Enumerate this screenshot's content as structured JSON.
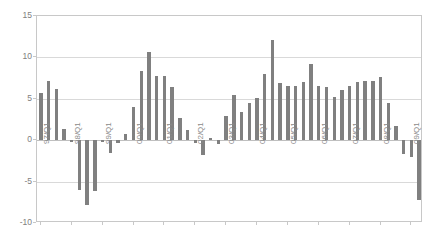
{
  "chart_data": {
    "type": "bar",
    "title": "",
    "subtitle": "",
    "xlabel": "",
    "ylabel": "",
    "ylim": [
      -10,
      15
    ],
    "yticks": [
      15,
      10,
      5,
      0,
      -5,
      -10
    ],
    "ytick_labels": [
      "15",
      "10",
      "5",
      "0",
      "-5",
      "-10"
    ],
    "grid": true,
    "legend": false,
    "legend_position": "none",
    "bar_color": "#808080",
    "axis_color": "#c8c8c8",
    "grid_color": "#d9d9d9",
    "label_color": "#808080",
    "categories": [
      "97/Q1",
      "97/Q2",
      "97/Q3",
      "97/Q4",
      "98/Q1",
      "98/Q2",
      "98/Q3",
      "98/Q4",
      "99/Q1",
      "99/Q2",
      "99/Q3",
      "99/Q4",
      "00/Q1",
      "00/Q2",
      "00/Q3",
      "00/Q4",
      "01/Q1",
      "01/Q2",
      "01/Q3",
      "01/Q4",
      "02/Q1",
      "02/Q2",
      "02/Q3",
      "02/Q4",
      "03/Q1",
      "03/Q2",
      "03/Q3",
      "03/Q4",
      "04/Q1",
      "04/Q2",
      "04/Q3",
      "04/Q4",
      "05/Q1",
      "05/Q2",
      "05/Q3",
      "05/Q4",
      "06/Q1",
      "06/Q2",
      "06/Q3",
      "06/Q4",
      "07/Q1",
      "07/Q2",
      "07/Q3",
      "07/Q4",
      "08/Q1",
      "08/Q2",
      "08/Q3",
      "08/Q4",
      "09/Q1",
      "09/Q2"
    ],
    "values": [
      5.7,
      7.2,
      6.2,
      1.4,
      -0.2,
      -6.0,
      -7.8,
      -6.1,
      -0.2,
      -1.5,
      -0.3,
      0.7,
      4.0,
      8.4,
      10.7,
      7.7,
      7.8,
      6.4,
      2.7,
      1.2,
      -0.3,
      -1.8,
      0.3,
      -0.5,
      2.9,
      5.5,
      3.4,
      4.5,
      5.1,
      8.0,
      12.1,
      6.9,
      6.5,
      6.6,
      7.0,
      9.2,
      6.5,
      6.4,
      5.2,
      6.1,
      6.6,
      7.0,
      7.2,
      7.2,
      7.6,
      4.5,
      1.7,
      -1.7,
      -2.0,
      -7.2
    ],
    "tick_label_categories": [
      "97/Q1",
      "98/Q1",
      "99/Q1",
      "00/Q1",
      "01/Q1",
      "02/Q1",
      "03/Q1",
      "04/Q1",
      "05/Q1",
      "06/Q1",
      "07/Q1",
      "08/Q1",
      "09/Q1"
    ]
  }
}
